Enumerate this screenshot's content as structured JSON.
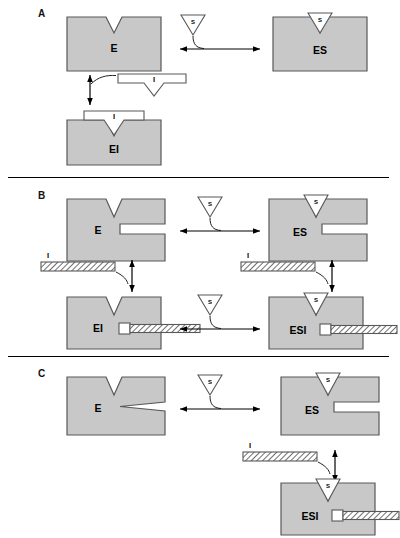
{
  "figure": {
    "colors": {
      "enzyme_fill": "#c8c8c8",
      "enzyme_stroke": "#58585a",
      "ligand_fill": "#ffffff",
      "ligand_stroke": "#58585a",
      "hatch_stroke": "#4a4a4a",
      "arrow": "#000000",
      "divider": "#000000",
      "text": "#000000"
    }
  },
  "panels": [
    {
      "id": "A",
      "label": "A",
      "caption_type": "competitive-inhibition",
      "species": {
        "free_enzyme": "E",
        "enzyme_substrate": "ES",
        "enzyme_inhibitor": "EI",
        "substrate": "S",
        "inhibitor": "I"
      },
      "reactions": [
        {
          "name": "E + S <=> ES",
          "arrow": "double-headed-horizontal",
          "ligand": "S"
        },
        {
          "name": "E + I <=> EI",
          "arrow": "double-headed-vertical",
          "ligand": "I"
        }
      ]
    },
    {
      "id": "B",
      "label": "B",
      "caption_type": "non-competitive-inhibition",
      "species": {
        "free_enzyme": "E",
        "enzyme_substrate": "ES",
        "enzyme_inhibitor": "EI",
        "enzyme_substrate_inhibitor": "ESI",
        "substrate": "S",
        "inhibitor": "I"
      },
      "reactions": [
        {
          "name": "E + S <=> ES",
          "arrow": "double-headed-horizontal",
          "ligand": "S"
        },
        {
          "name": "E + I <=> EI",
          "arrow": "double-headed-vertical",
          "ligand": "I"
        },
        {
          "name": "ES + I <=> ESI",
          "arrow": "double-headed-vertical",
          "ligand": "I"
        },
        {
          "name": "EI + S <=> ESI",
          "arrow": "double-headed-horizontal",
          "ligand": "S"
        }
      ]
    },
    {
      "id": "C",
      "label": "C",
      "caption_type": "uncompetitive-inhibition",
      "species": {
        "free_enzyme": "E",
        "enzyme_substrate": "ES",
        "enzyme_substrate_inhibitor": "ESI",
        "substrate": "S",
        "inhibitor": "I"
      },
      "reactions": [
        {
          "name": "E + S <=> ES",
          "arrow": "double-headed-horizontal",
          "ligand": "S"
        },
        {
          "name": "ES + I <=> ESI",
          "arrow": "double-headed-vertical",
          "ligand": "I"
        }
      ]
    }
  ],
  "labels": {
    "E": "E",
    "ES": "ES",
    "EI": "EI",
    "ESI": "ESI",
    "S": "S",
    "I": "I",
    "panelA": "A",
    "panelB": "B",
    "panelC": "C"
  }
}
